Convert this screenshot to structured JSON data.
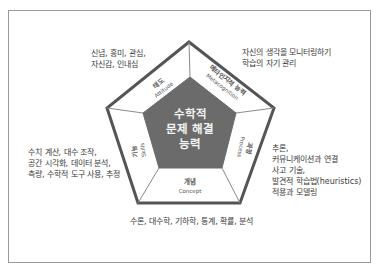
{
  "diagram": {
    "center": {
      "label": "수학적\n문제 해결\n능력"
    },
    "segments": [
      {
        "id": "attitude",
        "label_ko": "태도",
        "label_en": "Attitude",
        "description": "신념, 흥미, 관심,\n자신감, 인내심"
      },
      {
        "id": "metacognition",
        "label_ko": "메타인지적 능력",
        "label_en": "Metacognition",
        "description": "자신의 생각을 모니터링하기\n학습의 자기 관리"
      },
      {
        "id": "process",
        "label_ko": "과정",
        "label_en": "Process",
        "description": "추론,\n커뮤니케이션과 연결\n사고 기술,\n발견적 학습법(heuristics)\n적용과 모델링"
      },
      {
        "id": "concept",
        "label_ko": "개념",
        "label_en": "Concept",
        "description": "수론, 대수학, 기하학, 통계, 확률, 분석"
      },
      {
        "id": "skills",
        "label_ko": "기능",
        "label_en": "Skills",
        "description": "수치 계산, 대수 조작,\n공간 시각화, 데이터 분석,\n측량, 수학적 도구 사용, 추정"
      }
    ],
    "colors": {
      "outer_border": "#555555",
      "inner_fill": "#6b6b6b",
      "segment_fill": "#ffffff",
      "divider": "#8a8a8a",
      "frame_border": "#9a9a9a"
    }
  }
}
